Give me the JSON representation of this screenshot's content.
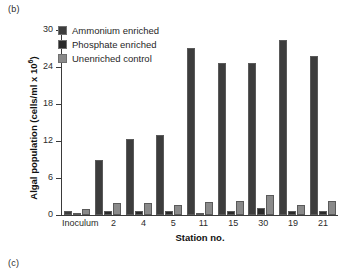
{
  "figure": {
    "panel_label_top": "(b)",
    "panel_label_bottom": "(c)"
  },
  "chart_data": {
    "type": "bar",
    "title": "",
    "xlabel": "Station no.",
    "ylabel": "Algal population (cells/ml x 10",
    "ylabel_exponent": "6",
    "ylabel_suffix": ")",
    "ylim": [
      0,
      30
    ],
    "yticks": [
      0,
      6,
      12,
      18,
      24,
      30
    ],
    "ytick_labels": [
      "0",
      "6",
      "12",
      "18",
      "24",
      "30"
    ],
    "grid": false,
    "legend_position": "upper left",
    "categories": [
      "Inoculum",
      "2",
      "4",
      "5",
      "11",
      "15",
      "30",
      "19",
      "21"
    ],
    "series": [
      {
        "name": "Ammonium enriched",
        "color": "#3d3d3d",
        "values": [
          0.6,
          9.0,
          12.4,
          12.9,
          27.1,
          24.7,
          24.6,
          28.4,
          25.8
        ]
      },
      {
        "name": "Phosphate enriched",
        "color": "#2a2a2a",
        "values": [
          0.4,
          0.7,
          0.6,
          0.7,
          0.4,
          0.7,
          1.1,
          0.7,
          0.6
        ]
      },
      {
        "name": "Unenriched control",
        "color": "#8a8a8a",
        "values": [
          0.9,
          1.9,
          1.9,
          1.6,
          2.1,
          2.2,
          3.2,
          1.7,
          2.2
        ]
      }
    ]
  },
  "legend": {
    "items": [
      {
        "label": "Ammonium enriched",
        "color": "#3d3d3d"
      },
      {
        "label": "Phosphate enriched",
        "color": "#2a2a2a"
      },
      {
        "label": "Unenriched control",
        "color": "#8a8a8a"
      }
    ]
  }
}
